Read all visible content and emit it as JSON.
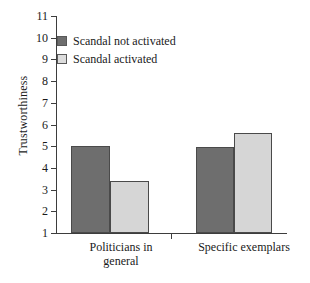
{
  "chart_data": {
    "type": "bar",
    "title": "",
    "xlabel": "",
    "ylabel": "Trustworthiness",
    "categories": [
      "Politicians in\ngeneral",
      "Specific exemplars"
    ],
    "series": [
      {
        "name": "Scandal not activated",
        "values": [
          5.0,
          4.95
        ],
        "color": "#6e6e6e"
      },
      {
        "name": "Scandal activated",
        "values": [
          3.4,
          5.6
        ],
        "color": "#d6d6d6"
      }
    ],
    "ylim": [
      1,
      11
    ],
    "yticks": [
      1,
      2,
      3,
      4,
      5,
      6,
      7,
      8,
      9,
      10,
      11
    ],
    "ytick_labels": [
      "1",
      "2",
      "3",
      "4",
      "5",
      "6",
      "7",
      "8",
      "9",
      "10",
      "11"
    ],
    "grid": false,
    "legend_position": "upper-left-inside",
    "axis_color": "#3d3d3d"
  }
}
